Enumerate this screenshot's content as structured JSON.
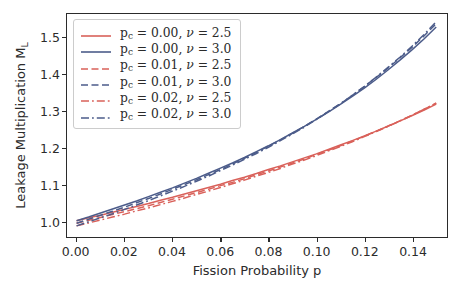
{
  "chart_data": {
    "type": "line",
    "title": "",
    "xlabel": "Fission Probability p",
    "ylabel": "Leakage Multiplication M_L",
    "ylabel_main": "Leakage Multiplication M",
    "ylabel_sub": "L",
    "xlim": [
      -0.004,
      0.1545
    ],
    "ylim": [
      0.9555,
      1.5655
    ],
    "xticks": [
      0.0,
      0.02,
      0.04,
      0.06,
      0.08,
      0.1,
      0.12,
      0.14
    ],
    "xticklabels": [
      "0.00",
      "0.02",
      "0.04",
      "0.06",
      "0.08",
      "0.10",
      "0.12",
      "0.14"
    ],
    "yticks": [
      1.0,
      1.1,
      1.2,
      1.3,
      1.4,
      1.5
    ],
    "yticklabels": [
      "1.0",
      "1.1",
      "1.2",
      "1.3",
      "1.4",
      "1.5"
    ],
    "grid": false,
    "legend_position": "upper left",
    "colors": {
      "nu_2_5": "#d9615a",
      "nu_3_0": "#4c5c8a",
      "spine": "#2b2b2b"
    },
    "x": [
      0.0,
      0.005,
      0.01,
      0.015,
      0.02,
      0.025,
      0.03,
      0.035,
      0.04,
      0.045,
      0.05,
      0.055,
      0.06,
      0.065,
      0.07,
      0.075,
      0.08,
      0.085,
      0.09,
      0.095,
      0.1,
      0.105,
      0.11,
      0.115,
      0.12,
      0.125,
      0.13,
      0.135,
      0.14,
      0.145,
      0.15
    ],
    "series": [
      {
        "name": "pc_0.00_nu_2.5",
        "label_pc": "0.00",
        "label_nu": "2.5",
        "color": "#d9615a",
        "dash": "solid",
        "values": [
          1.0,
          1.008,
          1.015,
          1.023,
          1.031,
          1.039,
          1.047,
          1.056,
          1.064,
          1.073,
          1.082,
          1.091,
          1.1,
          1.11,
          1.119,
          1.129,
          1.14,
          1.15,
          1.161,
          1.172,
          1.183,
          1.195,
          1.207,
          1.219,
          1.232,
          1.245,
          1.259,
          1.273,
          1.288,
          1.303,
          1.319
        ]
      },
      {
        "name": "pc_0.00_nu_3.0",
        "label_pc": "0.00",
        "label_nu": "3.0",
        "color": "#4c5c8a",
        "dash": "solid",
        "values": [
          1.0,
          1.01,
          1.021,
          1.032,
          1.043,
          1.054,
          1.066,
          1.078,
          1.09,
          1.103,
          1.116,
          1.13,
          1.144,
          1.158,
          1.173,
          1.189,
          1.205,
          1.222,
          1.24,
          1.258,
          1.277,
          1.297,
          1.318,
          1.34,
          1.363,
          1.387,
          1.413,
          1.44,
          1.468,
          1.498,
          1.53
        ]
      },
      {
        "name": "pc_0.01_nu_2.5",
        "label_pc": "0.01",
        "label_nu": "2.5",
        "color": "#d9615a",
        "dash": "dashed",
        "values": [
          0.993,
          1.001,
          1.009,
          1.017,
          1.025,
          1.033,
          1.041,
          1.05,
          1.059,
          1.068,
          1.077,
          1.086,
          1.096,
          1.105,
          1.115,
          1.126,
          1.136,
          1.147,
          1.158,
          1.169,
          1.181,
          1.193,
          1.205,
          1.218,
          1.231,
          1.245,
          1.259,
          1.274,
          1.289,
          1.305,
          1.321
        ]
      },
      {
        "name": "pc_0.01_nu_3.0",
        "label_pc": "0.01",
        "label_nu": "3.0",
        "color": "#4c5c8a",
        "dash": "dashed",
        "values": [
          0.993,
          1.004,
          1.015,
          1.026,
          1.037,
          1.049,
          1.061,
          1.073,
          1.086,
          1.099,
          1.112,
          1.126,
          1.14,
          1.155,
          1.171,
          1.187,
          1.204,
          1.221,
          1.239,
          1.258,
          1.278,
          1.299,
          1.32,
          1.343,
          1.367,
          1.392,
          1.418,
          1.446,
          1.475,
          1.506,
          1.539
        ]
      },
      {
        "name": "pc_0.02_nu_2.5",
        "label_pc": "0.02",
        "label_nu": "2.5",
        "color": "#d9615a",
        "dash": "dashdot",
        "values": [
          0.986,
          0.994,
          1.002,
          1.01,
          1.018,
          1.027,
          1.035,
          1.044,
          1.053,
          1.062,
          1.072,
          1.081,
          1.091,
          1.101,
          1.111,
          1.122,
          1.132,
          1.143,
          1.155,
          1.166,
          1.178,
          1.191,
          1.203,
          1.216,
          1.23,
          1.244,
          1.258,
          1.273,
          1.289,
          1.305,
          1.322
        ]
      },
      {
        "name": "pc_0.02_nu_3.0",
        "label_pc": "0.02",
        "label_nu": "3.0",
        "color": "#4c5c8a",
        "dash": "dashdot",
        "values": [
          0.986,
          0.997,
          1.008,
          1.019,
          1.031,
          1.043,
          1.055,
          1.068,
          1.081,
          1.094,
          1.108,
          1.122,
          1.137,
          1.152,
          1.168,
          1.184,
          1.201,
          1.219,
          1.237,
          1.256,
          1.277,
          1.298,
          1.32,
          1.343,
          1.367,
          1.393,
          1.42,
          1.448,
          1.478,
          1.51,
          1.544
        ]
      }
    ]
  },
  "legend": {
    "entries": [
      {
        "pc": "0.00",
        "nu": "2.5"
      },
      {
        "pc": "0.00",
        "nu": "3.0"
      },
      {
        "pc": "0.01",
        "nu": "2.5"
      },
      {
        "pc": "0.01",
        "nu": "3.0"
      },
      {
        "pc": "0.02",
        "nu": "2.5"
      },
      {
        "pc": "0.02",
        "nu": "3.0"
      }
    ]
  }
}
